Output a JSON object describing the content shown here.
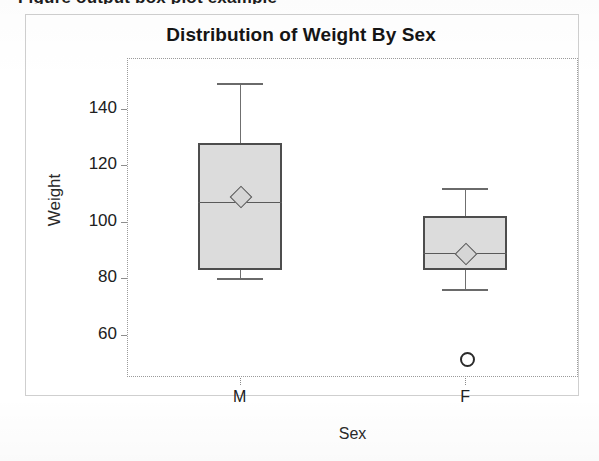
{
  "page": {
    "clipped_top_text": "Figure output box plot example"
  },
  "chart_data": {
    "type": "box",
    "title": "Distribution of Weight By Sex",
    "xlabel": "Sex",
    "ylabel": "Weight",
    "categories": [
      "M",
      "F"
    ],
    "ytick_labels": [
      "140",
      "120",
      "100",
      "80",
      "60"
    ],
    "ytick_values": [
      140,
      120,
      100,
      80,
      60
    ],
    "ylim": [
      45,
      158
    ],
    "grid": false,
    "legend": "none",
    "box_fill_color": "#dcdcdc",
    "box_border_color": "#4d4d4d",
    "boxes": [
      {
        "category": "M",
        "whisker_high": 149,
        "q3": 128,
        "median": 107,
        "mean": 109,
        "q1": 83,
        "whisker_low": 80,
        "outliers": []
      },
      {
        "category": "F",
        "whisker_high": 112,
        "q3": 102,
        "median": 89,
        "mean": 89,
        "q1": 83,
        "whisker_low": 76,
        "outliers": [
          52
        ]
      }
    ]
  }
}
